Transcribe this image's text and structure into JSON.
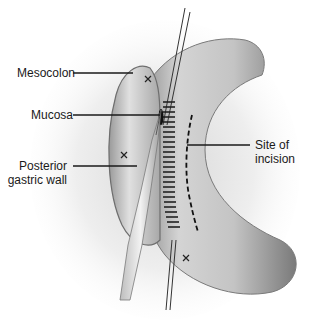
{
  "figure": {
    "labels": {
      "mesocolon": "Mesocolon",
      "mucosa": "Mucosa",
      "posterior_line1": "Posterior",
      "posterior_line2": "gastric wall",
      "site_line1": "Site of",
      "site_line2": "incision"
    },
    "colors": {
      "background": "#ffffff",
      "tissue_light": "#e6e6e6",
      "tissue_mid": "#bdbdbd",
      "tissue_dark": "#6e6e6e",
      "ink": "#1a1a1a"
    }
  }
}
